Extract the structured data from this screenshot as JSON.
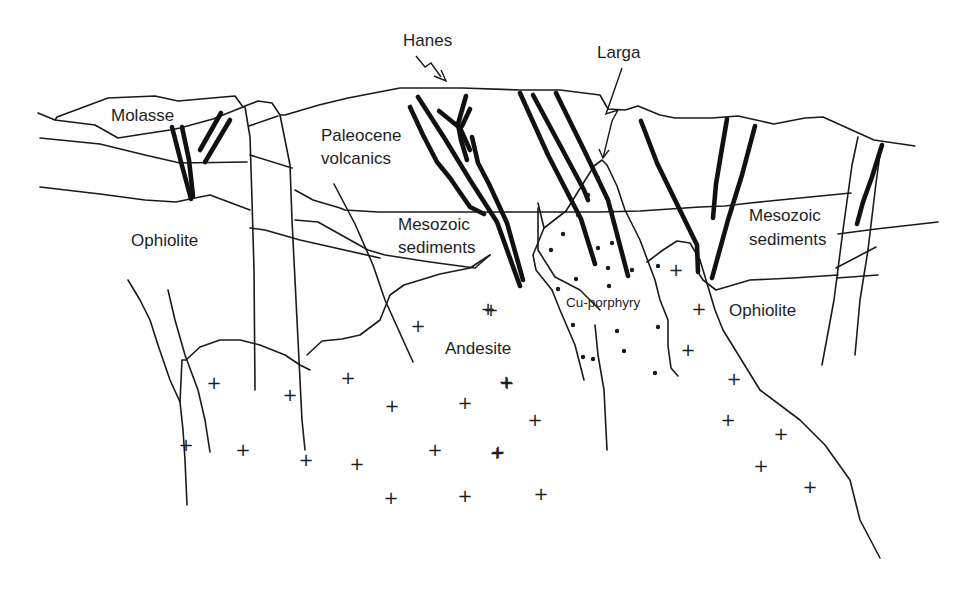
{
  "diagram": {
    "type": "geological-cross-section",
    "labels": [
      {
        "id": "hanes",
        "text": "Hanes",
        "x": 403,
        "y": 46,
        "size": "normal"
      },
      {
        "id": "larga",
        "text": "Larga",
        "x": 597,
        "y": 58,
        "size": "normal"
      },
      {
        "id": "molasse",
        "text": "Molasse",
        "x": 111,
        "y": 121,
        "size": "normal"
      },
      {
        "id": "paleocene-volcanics-1",
        "text": "Paleocene",
        "x": 321,
        "y": 141,
        "size": "normal"
      },
      {
        "id": "paleocene-volcanics-2",
        "text": "volcanics",
        "x": 321,
        "y": 164,
        "size": "normal"
      },
      {
        "id": "ophiolite-left",
        "text": "Ophiolite",
        "x": 131,
        "y": 246,
        "size": "normal"
      },
      {
        "id": "mesozoic-sediments-left-1",
        "text": "Mesozoic",
        "x": 398,
        "y": 230,
        "size": "normal"
      },
      {
        "id": "mesozoic-sediments-left-2",
        "text": "sediments",
        "x": 398,
        "y": 253,
        "size": "normal"
      },
      {
        "id": "mesozoic-sediments-right-1",
        "text": "Mesozoic",
        "x": 749,
        "y": 221,
        "size": "normal"
      },
      {
        "id": "mesozoic-sediments-right-2",
        "text": "sediments",
        "x": 749,
        "y": 245,
        "size": "normal"
      },
      {
        "id": "cu-porphyry",
        "text": "Cu-porphyry",
        "x": 566,
        "y": 307,
        "size": "small"
      },
      {
        "id": "ophiolite-right",
        "text": "Ophiolite",
        "x": 729,
        "y": 316,
        "size": "normal"
      },
      {
        "id": "andesite",
        "text": "Andesite",
        "x": 445,
        "y": 354,
        "size": "normal"
      }
    ],
    "units": [
      "Molasse",
      "Paleocene volcanics",
      "Mesozoic sediments",
      "Ophiolite",
      "Andesite",
      "Cu-porphyry"
    ],
    "deposits": [
      "Hanes",
      "Larga"
    ],
    "andesite_pluses": [
      [
        488,
        309
      ],
      [
        418,
        326
      ],
      [
        214,
        383
      ],
      [
        290,
        395
      ],
      [
        348,
        378
      ],
      [
        392,
        406
      ],
      [
        465,
        403
      ],
      [
        507,
        383
      ],
      [
        186,
        445
      ],
      [
        243,
        450
      ],
      [
        306,
        460
      ],
      [
        357,
        464
      ],
      [
        435,
        450
      ],
      [
        497,
        453
      ],
      [
        391,
        498
      ],
      [
        465,
        496
      ],
      [
        541,
        494
      ],
      [
        491,
        310
      ],
      [
        506,
        382
      ],
      [
        535,
        420
      ],
      [
        498,
        452
      ],
      [
        541,
        493
      ],
      [
        676,
        270
      ],
      [
        699,
        309
      ],
      [
        688,
        350
      ],
      [
        734,
        379
      ],
      [
        728,
        420
      ],
      [
        781,
        434
      ],
      [
        761,
        466
      ],
      [
        810,
        487
      ]
    ],
    "porphyry_dots": [
      [
        598,
        178
      ],
      [
        588,
        195
      ],
      [
        612,
        212
      ],
      [
        578,
        215
      ],
      [
        563,
        234
      ],
      [
        612,
        243
      ],
      [
        598,
        248
      ],
      [
        551,
        250
      ],
      [
        608,
        268
      ],
      [
        632,
        270
      ],
      [
        658,
        266
      ],
      [
        576,
        279
      ],
      [
        609,
        286
      ],
      [
        558,
        289
      ],
      [
        573,
        325
      ],
      [
        617,
        331
      ],
      [
        658,
        327
      ],
      [
        583,
        357
      ],
      [
        624,
        351
      ],
      [
        655,
        373
      ],
      [
        593,
        359
      ]
    ],
    "thick_lines": [
      "M172,127 L181,162 L191,199",
      "M182,127 L189,160 L193,196",
      "M200,150 L221,113",
      "M205,162 L230,120",
      "M410,107 L423,135 L437,162 L450,178 L470,207 L484,214",
      "M418,97 L445,139 L470,180 L497,222 L520,286",
      "M439,111 L460,128 L470,150",
      "M466,96 L458,124 L461,140 L467,160",
      "M470,109 L462,126",
      "M472,137 L478,163 L489,184 L507,223 L523,280",
      "M520,93 L548,155 L581,219 L595,264",
      "M533,95 L561,147 L584,190 L588,200",
      "M556,93 L585,152 L608,200 L628,276",
      "M641,121 L657,163 L675,200 L697,245 L698,272",
      "M727,119 L721,154 L716,184 L713,218",
      "M755,126 L742,175 L728,220 L712,278",
      "M882,145 L872,177 L863,202 L857,224"
    ],
    "thin_lines": [
      "M38,113 L55,120 L57,117 L108,98 L155,96 L178,101 L235,96 L243,107 L245,106 L258,101 L272,103 L280,115 L285,115 L319,105 L348,98 L400,88 L462,88 L520,90 L560,90 L600,95 L608,109 L625,110 L638,106 L660,115 L675,118 L712,118 L738,116 L774,124 L805,118 L823,117 L874,140 L915,146",
      "M55,120 L95,125 L118,138 L150,133 L170,130 L180,128 L213,119 L243,107",
      "M40,138 L100,144 L145,155 L180,163 L247,162",
      "M40,187 L100,194 L145,200 L176,202 L190,199 L210,195 L250,210",
      "M245,107 L250,137 L252,200 L254,270 L255,390",
      "M280,115 L290,165 L292,220 L296,300 L302,420 L305,450",
      "M249,126 L278,116",
      "M250,155 L292,168",
      "M295,190 L313,200 L340,208 L345,210 L378,212 L405,212 L520,212 L600,212 L640,211 L700,207 L725,206 L750,203 L810,197 L851,193",
      "M295,220 L318,222 L368,250 L385,255 L430,262 L475,268 L490,255",
      "M250,228 L265,230 L300,240 L380,258",
      "M334,184 L355,224 L373,265 L385,300 L413,362",
      "M490,255 L470,268 L440,274 L404,285 L390,295 L380,320 L360,335 L342,339 L322,341 L307,355",
      "M128,280 L140,300 L150,320 L158,345 L170,380 L180,402 L183,430 L185,460 L187,505",
      "M168,290 L175,320 L185,355 L198,390 L205,420 L210,452",
      "M180,402 L182,360 L186,360 L200,347 L220,340 L240,340 L260,345 L285,355 L300,365 L310,370",
      "M538,203 L544,228 L566,211",
      "M566,211 L594,166 L602,160 L607,165 L617,186 L625,210 L640,240 L655,280 L660,300 L668,320 L668,346 L671,368 L678,376",
      "M538,208 L538,250 L555,277 L580,290 L600,310",
      "M544,228 L533,255 L536,270 L552,290",
      "M552,290 L560,310 L575,345 L584,380",
      "M595,325 L598,355 L604,390 L607,450",
      "M647,262 L663,250 L677,241 L690,243 L700,260",
      "M698,272 L703,280 L716,290 L750,280 L793,278 L838,275",
      "M700,260 L715,310 L723,330 L760,390 L800,420 L825,445 L850,480 L860,520 L880,558",
      "M858,137 L852,165 L843,230 L834,300 L822,365",
      "M881,147 L876,183 L868,250 L860,300 L855,355",
      "M838,234 L876,229 L938,222",
      "M836,268 L876,247",
      "M837,278 L878,275"
    ],
    "arrows": {
      "hanes_zigzag": "M416,56 L425,67 L431,63 L441,77",
      "hanes_head": "M434,76 L446,81 L441,70",
      "larga_zigzag": "M622,68 L606,114 L618,110 L612,121 L603,158",
      "larga_head": "M599,149 L603,158 L609,150"
    },
    "colors": {
      "ink": "#1a1a1a",
      "background": "#ffffff"
    }
  }
}
